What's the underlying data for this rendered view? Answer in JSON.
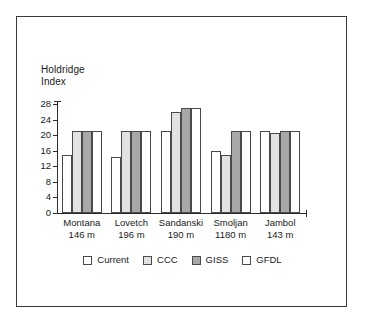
{
  "chart_data": {
    "type": "bar",
    "title": "Holdridge\nIndex",
    "xlabel": "",
    "ylabel": "",
    "ylim": [
      0,
      28
    ],
    "yticks": [
      0,
      4,
      8,
      12,
      16,
      20,
      24,
      28
    ],
    "grid": false,
    "legend_position": "bottom",
    "categories": [
      {
        "name": "Montana",
        "elevation": "146 m"
      },
      {
        "name": "Lovetch",
        "elevation": "196 m"
      },
      {
        "name": "Sandanski",
        "elevation": "190 m"
      },
      {
        "name": "Smoljan",
        "elevation": "1180 m"
      },
      {
        "name": "Jambol",
        "elevation": "143 m"
      }
    ],
    "series": [
      {
        "name": "Current",
        "color": "#ffffff",
        "values": [
          15,
          14.5,
          21,
          16,
          21
        ]
      },
      {
        "name": "CCC",
        "color": "#e2e2e2",
        "values": [
          21,
          21,
          26,
          15,
          20.5
        ]
      },
      {
        "name": "GISS",
        "color": "#a8a8a8",
        "values": [
          21,
          21,
          27,
          21,
          21
        ]
      },
      {
        "name": "GFDL",
        "color": "#ffffff",
        "values": [
          21,
          21,
          27,
          21,
          21
        ]
      }
    ]
  },
  "figure": {
    "border_color": "#3a3a3a",
    "axis_color": "#2c2c2c",
    "bar_edge_color": "#4a4a4a"
  }
}
